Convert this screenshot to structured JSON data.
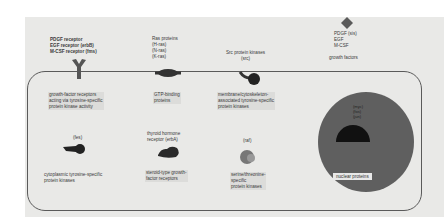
{
  "diagram": {
    "title": "",
    "extracellular": {
      "receptors_label": "PDGF receptor\nEGF receptor (erbB)\nM-CSF receptor (fms)",
      "ras_label": "Ras proteins\n(H-ras)\n(N-ras)\n(K-ras)",
      "src_label": "Src protein kinases\n(src)",
      "growth_factor_ligands": "PDGF (sis)\nEGF\nM-CSF",
      "growth_factors_caption": "growth factors"
    },
    "intracellular": {
      "growth_factor_receptors": "growth-factor receptors\nacting via tyrosine-specific\nprotein kinase activity",
      "gtp_binding": "GTP-binding\nproteins",
      "membrane_kinases": "membrane/cytoskeleton-\nassociated tyrosine-specific\nprotein kinases",
      "fes_label": "(fes)",
      "cytoplasmic_kinases": "cytoplasmic tyrosine-specific\nprotein kinases",
      "thyroid_label": "thyroid hormone\nreceptor (erbA)",
      "steroid_receptors": "steroid-type growth-\nfactor receptors",
      "raf_label": "(raf)",
      "serine_kinases": "serine/threonine-\nspecific\nprotein kinases"
    },
    "nucleus": {
      "genes": "(myc)\n(fos)\n(jun)",
      "caption": "nuclear proteins"
    }
  },
  "colors": {
    "paper": "#e9e9e7",
    "membrane": "#5a5a5a",
    "nucleus": "#5f5f5f",
    "icon": "#4a4a4a"
  }
}
